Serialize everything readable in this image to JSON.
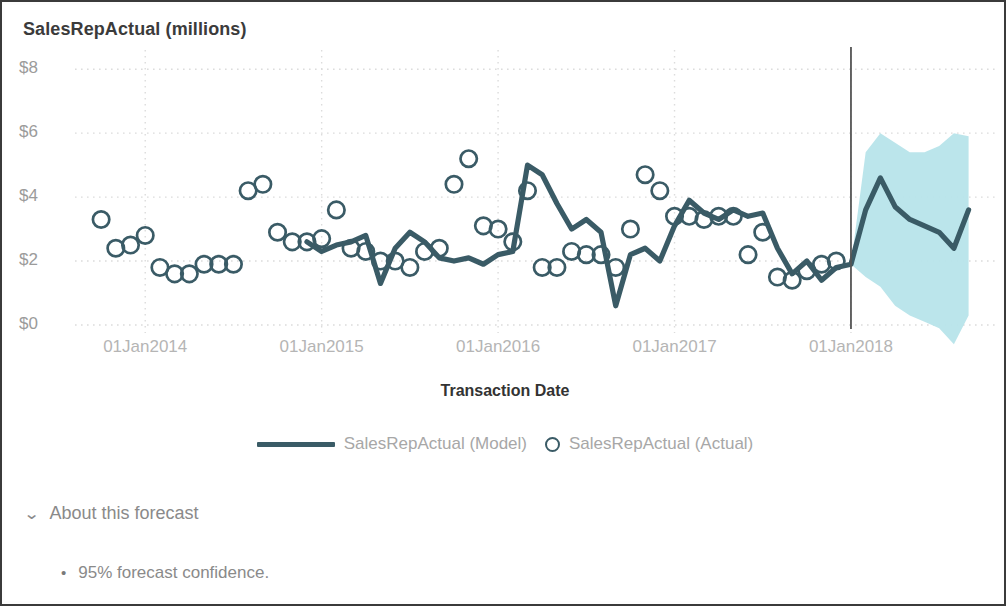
{
  "colors": {
    "line": "#3a5b66",
    "marker_stroke": "#3a5b66",
    "band": "#b7e4ea",
    "grid": "#dcdcdc",
    "axis": "#8a8a8a",
    "divider": "#555555",
    "title_text": "#3b3b3b",
    "label_text": "#9b9b9b"
  },
  "header": {
    "title": "SalesRepActual (millions)"
  },
  "axis": {
    "x_title": "Transaction Date"
  },
  "legend": {
    "items": [
      {
        "label": "SalesRepActual (Model)",
        "marker": "line-marker"
      },
      {
        "label": "SalesRepActual (Actual)",
        "marker": "circle-marker"
      }
    ]
  },
  "about": {
    "chevron": "⌄",
    "label": "About this forecast",
    "notes": [
      {
        "bullet": "•",
        "text": "95% forecast confidence."
      }
    ]
  },
  "chart_data": {
    "type": "line",
    "title": "SalesRepActual (millions)",
    "xlabel": "Transaction Date",
    "ylabel": "SalesRepActual (millions)",
    "ylim": [
      0,
      8.6
    ],
    "yticks": [
      0,
      2,
      4,
      6,
      8
    ],
    "ytick_labels": [
      "$0",
      "$2",
      "$4",
      "$6",
      "$8"
    ],
    "xticks": [
      "01Jan2014",
      "01Jan2015",
      "01Jan2016",
      "01Jan2017",
      "01Jan2018"
    ],
    "xlim": [
      "01Jul2013",
      "01Nov2018"
    ],
    "grid": "dotted-both",
    "legend_position": "bottom-center",
    "forecast_start": "01Jan2018",
    "confidence_level": "95%",
    "series": [
      {
        "name": "SalesRepActual (Actual)",
        "type": "scatter",
        "marker": "open-circle",
        "x": [
          "01Oct2013",
          "01Nov2013",
          "01Dec2013",
          "01Jan2014",
          "01Feb2014",
          "01Mar2014",
          "01Apr2014",
          "01May2014",
          "01Jun2014",
          "01Jul2014",
          "01Aug2014",
          "01Sep2014",
          "01Oct2014",
          "01Nov2014",
          "01Dec2014",
          "01Jan2015",
          "01Feb2015",
          "01Mar2015",
          "01Apr2015",
          "01May2015",
          "01Jun2015",
          "01Jul2015",
          "01Aug2015",
          "01Sep2015",
          "01Oct2015",
          "01Nov2015",
          "01Dec2015",
          "01Jan2016",
          "01Feb2016",
          "01Mar2016",
          "01Apr2016",
          "01May2016",
          "01Jun2016",
          "01Jul2016",
          "01Aug2016",
          "01Sep2016",
          "01Oct2016",
          "01Nov2016",
          "01Dec2016",
          "01Jan2017",
          "01Feb2017",
          "01Mar2017",
          "01Apr2017",
          "01May2017",
          "01Jun2017",
          "01Jul2017",
          "01Aug2017",
          "01Sep2017",
          "01Oct2017",
          "01Nov2017",
          "01Dec2017"
        ],
        "values": [
          3.3,
          2.4,
          2.5,
          2.8,
          1.8,
          1.6,
          1.6,
          1.9,
          1.9,
          1.9,
          4.2,
          4.4,
          2.9,
          2.6,
          2.6,
          2.7,
          3.6,
          2.4,
          2.3,
          2.0,
          2.0,
          1.8,
          2.3,
          2.4,
          4.4,
          5.2,
          3.1,
          3.0,
          2.6,
          4.2,
          1.8,
          1.8,
          2.3,
          2.2,
          2.2,
          1.8,
          3.0,
          4.7,
          4.2,
          3.4,
          3.4,
          3.3,
          3.4,
          3.4,
          2.2,
          2.9,
          1.5,
          1.4,
          1.7,
          1.9,
          2.0
        ]
      },
      {
        "name": "SalesRepActual (Model)",
        "type": "line",
        "x": [
          "01Dec2014",
          "01Jan2015",
          "01Feb2015",
          "01Mar2015",
          "01Apr2015",
          "01May2015",
          "01Jun2015",
          "01Jul2015",
          "01Aug2015",
          "01Sep2015",
          "01Oct2015",
          "01Nov2015",
          "01Dec2015",
          "01Jan2016",
          "01Feb2016",
          "01Mar2016",
          "01Apr2016",
          "01May2016",
          "01Jun2016",
          "01Jul2016",
          "01Aug2016",
          "01Sep2016",
          "01Oct2016",
          "01Nov2016",
          "01Dec2016",
          "01Jan2017",
          "01Feb2017",
          "01Mar2017",
          "01Apr2017",
          "01May2017",
          "01Jun2017",
          "01Jul2017",
          "01Aug2017",
          "01Sep2017",
          "01Oct2017",
          "01Nov2017",
          "01Dec2017",
          "01Jan2018",
          "01Feb2018",
          "01Mar2018",
          "01Apr2018",
          "01May2018",
          "01Jun2018",
          "01Jul2018",
          "01Aug2018",
          "01Sep2018"
        ],
        "values": [
          2.6,
          2.3,
          2.5,
          2.6,
          2.8,
          1.3,
          2.4,
          2.9,
          2.6,
          2.1,
          2.0,
          2.1,
          1.9,
          2.2,
          2.3,
          5.0,
          4.7,
          3.8,
          3.0,
          3.3,
          2.9,
          0.6,
          2.2,
          2.4,
          2.0,
          3.1,
          3.9,
          3.5,
          3.3,
          3.6,
          3.4,
          3.5,
          2.4,
          1.6,
          2.0,
          1.4,
          1.8,
          1.9,
          3.6,
          4.6,
          3.7,
          3.3,
          3.1,
          2.9,
          2.4,
          3.6
        ]
      },
      {
        "name": "95% Confidence Interval",
        "type": "band",
        "x": [
          "01Jan2018",
          "01Feb2018",
          "01Mar2018",
          "01Apr2018",
          "01May2018",
          "01Jun2018",
          "01Jul2018",
          "01Aug2018",
          "01Sep2018"
        ],
        "lower": [
          1.9,
          1.5,
          1.2,
          0.6,
          0.3,
          0.1,
          -0.1,
          -0.6,
          0.3
        ],
        "upper": [
          1.9,
          5.4,
          6.0,
          5.7,
          5.4,
          5.4,
          5.6,
          6.0,
          5.9
        ]
      }
    ]
  }
}
